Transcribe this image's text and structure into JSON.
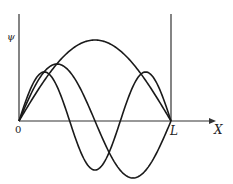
{
  "diagram": {
    "labels": {
      "y_axis": "ψ",
      "origin": "0",
      "wall": "L",
      "x_axis": "X"
    },
    "geometry": {
      "origin_x": 19,
      "baseline_y": 121,
      "wall_x": 171,
      "axis_top_y": 14,
      "arrow_end_x": 216
    },
    "curves": [
      {
        "name": "n=1",
        "n": 1,
        "amplitude_px": 81
      },
      {
        "name": "n=2",
        "n": 2,
        "amplitude_px": 57
      },
      {
        "name": "n=3",
        "n": 3,
        "amplitude_px": 49
      }
    ],
    "colors": {
      "stroke": "#1a1a1a",
      "axis": "#333333",
      "background": "#ffffff"
    }
  }
}
